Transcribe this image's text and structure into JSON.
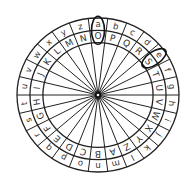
{
  "diagram": {
    "type": "cipher-wheel",
    "outer_ring": [
      "a",
      "b",
      "c",
      "d",
      "e",
      "f",
      "g",
      "h",
      "i",
      "j",
      "k",
      "l",
      "m",
      "n",
      "o",
      "p",
      "q",
      "r",
      "s",
      "t",
      "u",
      "v",
      "w",
      "x",
      "y",
      "z"
    ],
    "inner_ring": [
      "O",
      "P",
      "Q",
      "R",
      "S",
      "T",
      "U",
      "V",
      "W",
      "X",
      "Y",
      "Z",
      "A",
      "B",
      "C",
      "D",
      "E",
      "F",
      "G",
      "H",
      "I",
      "J",
      "K",
      "L",
      "M",
      "N"
    ],
    "highlighted_pairs": [
      {
        "outer": "a",
        "inner": "O"
      },
      {
        "outer": "e",
        "inner": "S"
      }
    ],
    "colors": {
      "line": "#222222",
      "text": "#333333",
      "background": "#ffffff"
    }
  }
}
